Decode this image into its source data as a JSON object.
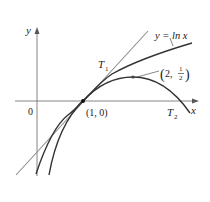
{
  "figure": {
    "type": "diagram",
    "axes": {
      "x_label": "x",
      "y_label": "y",
      "origin_label": "0"
    },
    "labels": {
      "curve_ln": "y = ln x",
      "t1": "T",
      "t1_sub": "1",
      "t2": "T",
      "t2_sub": "2",
      "point_a": "(1, 0)",
      "point_b_x": "2,",
      "point_b_num": "1",
      "point_b_den": "2"
    },
    "curves": [
      {
        "name": "ln x",
        "expr": "y = ln x",
        "color": "#333333"
      },
      {
        "name": "T1",
        "expr": "y = x - 1",
        "color": "#8a8a8a"
      },
      {
        "name": "T2",
        "expr": "y = (x-1) - (x-1)^2/2",
        "color": "#333333"
      }
    ],
    "points": [
      {
        "label": "(1, 0)",
        "x": 1,
        "y": 0
      },
      {
        "label": "(2, 1/2)",
        "x": 2,
        "y": 0.5
      }
    ]
  }
}
